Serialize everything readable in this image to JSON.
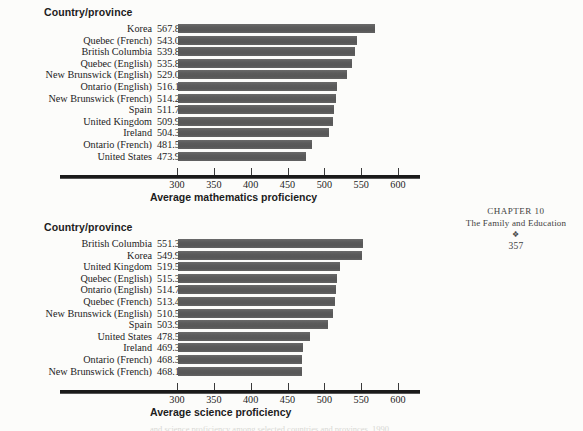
{
  "page": {
    "running_head": {
      "chapter": "CHAPTER 10",
      "section": "The Family and Education",
      "ornament": "❖",
      "page_number": "357"
    },
    "caption_cut": "and science proficiency among selected countries and provinces, 1990"
  },
  "charts": [
    {
      "id": "chart-math",
      "column_header": "Country/province",
      "axis_title": "Average mathematics proficiency",
      "chart_data": {
        "type": "bar",
        "orientation": "horizontal",
        "title": "",
        "xlabel": "Average mathematics proficiency",
        "ylabel": "Country/province",
        "xlim": [
          300,
          600
        ],
        "ticks": [
          300,
          350,
          400,
          450,
          500,
          550,
          600
        ],
        "grid": false,
        "legend": "none",
        "categories": [
          "Korea",
          "Quebec (French)",
          "British Columbia",
          "Quebec (English)",
          "New Brunswick (English)",
          "Ontario (English)",
          "New Brunswick (French)",
          "Spain",
          "United Kingdom",
          "Ireland",
          "Ontario (French)",
          "United States"
        ],
        "values": [
          567.8,
          543.0,
          539.8,
          535.8,
          529.0,
          516.1,
          514.2,
          511.7,
          509.9,
          504.3,
          481.5,
          473.9
        ],
        "value_labels": [
          "567.8",
          "543.0",
          "539.8",
          "535.8",
          "529.0",
          "516.1",
          "514.2",
          "511.7",
          "509.9",
          "504.3",
          "481.5",
          "473.9"
        ]
      }
    },
    {
      "id": "chart-sci",
      "column_header": "Country/province",
      "axis_title": "Average science proficiency",
      "chart_data": {
        "type": "bar",
        "orientation": "horizontal",
        "title": "",
        "xlabel": "Average science proficiency",
        "ylabel": "Country/province",
        "xlim": [
          300,
          600
        ],
        "ticks": [
          300,
          350,
          400,
          450,
          500,
          550,
          600
        ],
        "grid": false,
        "legend": "none",
        "categories": [
          "British Columbia",
          "Korea",
          "United Kingdom",
          "Quebec (English)",
          "Ontario (English)",
          "Quebec (French)",
          "New Brunswick (English)",
          "Spain",
          "United States",
          "Ireland",
          "Ontario (French)",
          "New Brunswick (French)"
        ],
        "values": [
          551.3,
          549.9,
          519.5,
          515.3,
          514.7,
          513.4,
          510.5,
          503.9,
          478.5,
          469.3,
          468.3,
          468.1
        ],
        "value_labels": [
          "551.3",
          "549.9",
          "519.5",
          "515.3",
          "514.7",
          "513.4",
          "510.5",
          "503.9",
          "478.5",
          "469.3",
          "468.3",
          "468.1"
        ]
      }
    }
  ],
  "style": {
    "bar_color": "#5d5d5d",
    "axis_color": "#1a1a1a",
    "text_color": "#232323",
    "page_background": "#fcfcfa"
  }
}
